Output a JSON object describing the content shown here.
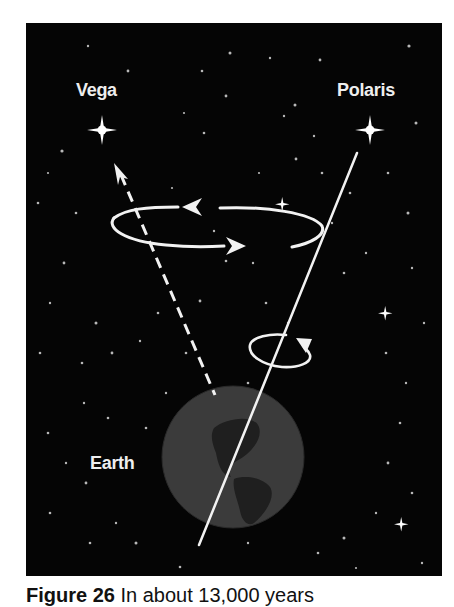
{
  "diagram": {
    "labels": {
      "vega": "Vega",
      "polaris": "Polaris",
      "earth": "Earth"
    },
    "elements": {
      "axis_current": "solid line pointing toward Polaris",
      "axis_future": "dashed line pointing toward Vega",
      "precession_circle": "large ellipse with arrows showing precession direction",
      "rotation_circle": "small ellipse with arrow showing Earth's daily rotation"
    },
    "colors": {
      "background": "#050505",
      "foreground": "#f2f2f2",
      "earth": "#3a3a3a",
      "continents": "#1e1e1e"
    }
  },
  "caption": {
    "prefix": "Figure 26",
    "text": "In about 13,000 years"
  }
}
